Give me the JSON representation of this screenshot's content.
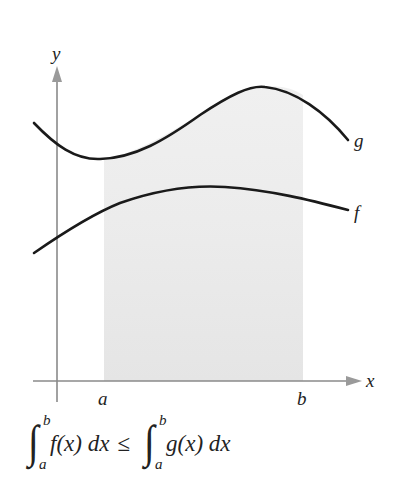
{
  "figure": {
    "axes": {
      "x_label": "x",
      "y_label": "y"
    },
    "interval": {
      "a_label": "a",
      "b_label": "b"
    },
    "curves": [
      {
        "name": "g",
        "label": "g",
        "description": "upper curve"
      },
      {
        "name": "f",
        "label": "f",
        "description": "lower curve"
      }
    ],
    "shaded_region": {
      "from": "a",
      "to": "b",
      "color": "#ececec"
    },
    "colors": {
      "curve": "#1a1a1a",
      "axis": "#8a8a8a",
      "shade_upper": "#efefef",
      "shade_lower": "#e6e6e6"
    }
  },
  "formula": {
    "left_integral": {
      "upper": "b",
      "lower": "a",
      "integrand": "f(x) dx"
    },
    "relation": "≤",
    "right_integral": {
      "upper": "b",
      "lower": "a",
      "integrand": "g(x) dx"
    }
  }
}
